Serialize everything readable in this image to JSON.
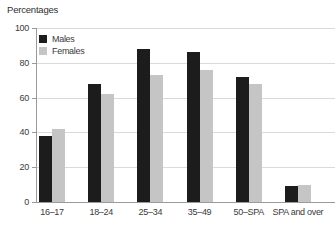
{
  "chart_data": {
    "type": "bar",
    "ylabel": "Percentages",
    "categories": [
      "16–17",
      "18–24",
      "25–34",
      "35–49",
      "50–SPA",
      "SPA and over"
    ],
    "series": [
      {
        "name": "Males",
        "color": "#1c1c1c",
        "values": [
          38,
          68,
          88,
          86,
          72,
          9
        ]
      },
      {
        "name": "Females",
        "color": "#c5c5c5",
        "values": [
          42,
          62,
          73,
          76,
          68,
          10
        ]
      }
    ],
    "ylim": [
      0,
      100
    ],
    "yticks": [
      0,
      20,
      40,
      60,
      80,
      100
    ],
    "grid": true,
    "legend_position": "top-left-inside"
  },
  "colors": {
    "males_bar": "#1c1c1c",
    "females_bar": "#c5c5c5",
    "gridline": "#dadada",
    "axis": "#9a9a9a",
    "text": "#3a3a3a",
    "background": "#ffffff"
  }
}
